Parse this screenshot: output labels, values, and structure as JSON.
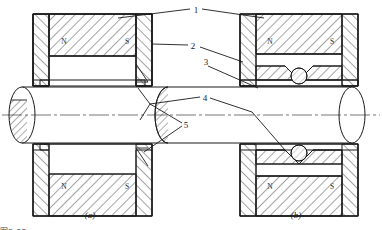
{
  "figure": {
    "type": "engineering-cross-section",
    "stroke_color": "#1a1a1a",
    "hatch_color": "#1a1a1a",
    "background": "#ffffff"
  },
  "callouts": [
    {
      "id": "1",
      "label": "1",
      "x": 196,
      "y": 10
    },
    {
      "id": "2",
      "label": "2",
      "x": 193,
      "y": 46
    },
    {
      "id": "3",
      "label": "3",
      "x": 206,
      "y": 62
    },
    {
      "id": "4",
      "label": "4",
      "x": 205,
      "y": 98
    },
    {
      "id": "5",
      "label": "5",
      "x": 186,
      "y": 125
    }
  ],
  "captions": [
    {
      "id": "a",
      "label": "(a)",
      "x": 90,
      "y": 215
    },
    {
      "id": "b",
      "label": "(b)",
      "x": 296,
      "y": 215
    }
  ],
  "poles": {
    "north": "N",
    "south": "S",
    "placements": [
      {
        "panel": "a",
        "position": "upper-left",
        "label": "N",
        "x": 64,
        "y": 41
      },
      {
        "panel": "a",
        "position": "upper-right",
        "label": "S",
        "x": 127,
        "y": 41
      },
      {
        "panel": "a",
        "position": "lower-left",
        "label": "N",
        "x": 64,
        "y": 186
      },
      {
        "panel": "a",
        "position": "lower-right",
        "label": "S",
        "x": 127,
        "y": 186
      },
      {
        "panel": "b",
        "position": "upper-left",
        "label": "N",
        "x": 270,
        "y": 41
      },
      {
        "panel": "b",
        "position": "upper-right",
        "label": "S",
        "x": 332,
        "y": 41
      },
      {
        "panel": "b",
        "position": "lower-left",
        "label": "N",
        "x": 270,
        "y": 186
      },
      {
        "panel": "b",
        "position": "lower-right",
        "label": "S",
        "x": 332,
        "y": 186
      }
    ]
  },
  "footnote": {
    "text": "图5-22"
  }
}
